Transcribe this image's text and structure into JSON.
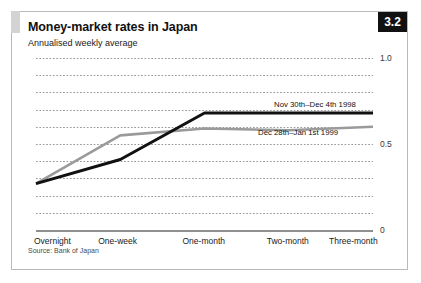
{
  "chart": {
    "badge": "3.2",
    "title": "Money-market rates in Japan",
    "subtitle": "Annualised weekly average",
    "source": "Source: Bank of Japan"
  },
  "chart_data": {
    "type": "line",
    "title": "Money-market rates in Japan",
    "subtitle": "Annualised weekly average",
    "xlabel": "",
    "ylabel": "",
    "ylim": [
      0,
      1.0
    ],
    "yticks": [
      0,
      0.5,
      1.0
    ],
    "ytick_labels": [
      "0",
      "0.5",
      "1.0"
    ],
    "grid": "horizontal-dotted",
    "gridline_step": 0.1,
    "legend_position": "inline-annotation",
    "categories": [
      "Overnight",
      "One-week",
      "One-month",
      "Two-month",
      "Three-month"
    ],
    "series": [
      {
        "name": "Nov 30th–Dec 4th 1998",
        "color": "#111111",
        "values": [
          0.27,
          0.41,
          0.68,
          0.68,
          0.68
        ]
      },
      {
        "name": "Dec 28th–Jan 1st 1999",
        "color": "#9a9a9a",
        "values": [
          0.27,
          0.55,
          0.59,
          0.58,
          0.6
        ]
      }
    ]
  },
  "colors": {
    "badge_bg": "#111111",
    "badge_fg": "#ffffff",
    "frame": "#b9b9b9",
    "accent": "#d3d3d3",
    "series_dark": "#111111",
    "series_light": "#9a9a9a"
  }
}
